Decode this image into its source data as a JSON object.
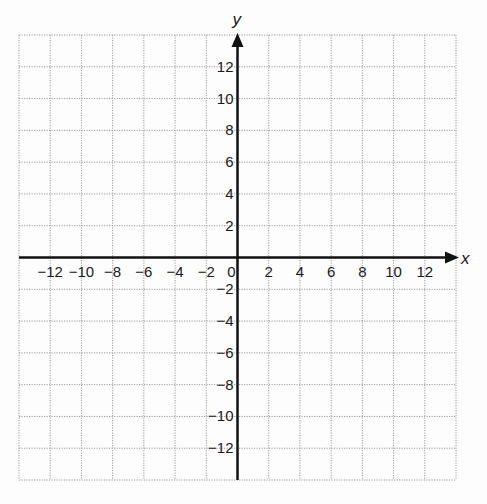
{
  "chart_data": {
    "type": "scatter",
    "title": "",
    "xlabel": "x",
    "ylabel": "y",
    "xlim": [
      -14,
      14
    ],
    "ylim": [
      -14,
      14
    ],
    "grid": true,
    "grid_step": 2,
    "x_ticks": [
      -12,
      -10,
      -8,
      -6,
      -4,
      -2,
      0,
      2,
      4,
      6,
      8,
      10,
      12
    ],
    "y_ticks": [
      -12,
      -10,
      -8,
      -6,
      -4,
      -2,
      2,
      4,
      6,
      8,
      10,
      12
    ],
    "x_tick_labels": [
      "−12",
      "−10",
      "−8",
      "−6",
      "−4",
      "−2",
      "0",
      "2",
      "4",
      "6",
      "8",
      "10",
      "12"
    ],
    "y_tick_labels": [
      "−12",
      "−10",
      "−8",
      "−6",
      "−4",
      "−2",
      "2",
      "4",
      "6",
      "8",
      "10",
      "12"
    ],
    "series": [],
    "legend": null
  },
  "colors": {
    "grid": "#9a9a9a",
    "axis": "#111111",
    "background": "#fdfdfd"
  }
}
